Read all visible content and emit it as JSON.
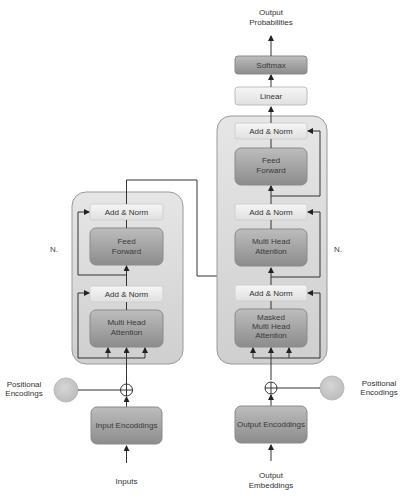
{
  "colors": {
    "stack_bg": "#d9d9d9",
    "stack_border": "#9a9a9a",
    "add_norm_fill": "#ececec",
    "sublayer_fill": "#9e9e9e",
    "positional_circle": "#c8c8c8",
    "line": "#333333"
  },
  "encoder": {
    "repeat_label": "N.",
    "add_norm_top": "Add & Norm",
    "feed_forward": [
      "Feed",
      "Forward"
    ],
    "add_norm_bottom": "Add & Norm",
    "attention": [
      "Multi Head",
      "Attention"
    ],
    "embedding_box": "Input Encoddings",
    "input_label": "Inputs",
    "positional": [
      "Positional",
      "Encodings"
    ]
  },
  "decoder": {
    "repeat_label": "N.",
    "add_norm_top": "Add & Norm",
    "feed_forward": [
      "Feed",
      "Forward"
    ],
    "add_norm_mid": "Add & Norm",
    "attention": [
      "Multi Head",
      "Attention"
    ],
    "add_norm_bottom": "Add & Norm",
    "masked_attention": [
      "Masked",
      "Multi Head",
      "Attention"
    ],
    "embedding_box": "Output Encoddings",
    "input_label": [
      "Output",
      "Embeddings"
    ],
    "positional": [
      "Positional",
      "Encodings"
    ]
  },
  "head": {
    "linear": "Linear",
    "softmax": "Softmax",
    "output_label": [
      "Output",
      "Probabilities"
    ]
  }
}
